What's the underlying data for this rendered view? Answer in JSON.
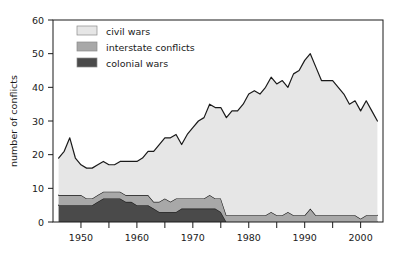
{
  "chart_data": {
    "type": "area",
    "stacked": true,
    "title": "",
    "subtitle": "",
    "xlabel": "",
    "ylabel": "number of conflicts",
    "xlim": [
      1945,
      2004
    ],
    "ylim": [
      0,
      60
    ],
    "yticks": [
      0,
      10,
      20,
      30,
      40,
      50,
      60
    ],
    "ytick_labels": [
      "0",
      "10",
      "20",
      "30",
      "40",
      "50",
      "60"
    ],
    "xticks": [
      1950,
      1955,
      1960,
      1965,
      1970,
      1975,
      1980,
      1985,
      1990,
      1995,
      2000
    ],
    "xtick_labels": [
      "1950",
      "",
      "1960",
      "",
      "1970",
      "",
      "1980",
      "",
      "1990",
      "",
      "2000"
    ],
    "xtick_labels_major": [
      "1950",
      "1960",
      "1970",
      "1980",
      "1990",
      "2000"
    ],
    "xtick_minor_interval": 5,
    "grid": false,
    "legend_position": "top-left",
    "x": [
      1946,
      1947,
      1948,
      1949,
      1950,
      1951,
      1952,
      1953,
      1954,
      1955,
      1956,
      1957,
      1958,
      1959,
      1960,
      1961,
      1962,
      1963,
      1964,
      1965,
      1966,
      1967,
      1968,
      1969,
      1970,
      1971,
      1972,
      1973,
      1974,
      1975,
      1976,
      1977,
      1978,
      1979,
      1980,
      1981,
      1982,
      1983,
      1984,
      1985,
      1986,
      1987,
      1988,
      1989,
      1990,
      1991,
      1992,
      1993,
      1994,
      1995,
      1996,
      1997,
      1998,
      1999,
      2000,
      2001,
      2002,
      2003
    ],
    "series": [
      {
        "name": "colonial wars",
        "color": "#4a4a4a",
        "values": [
          5,
          5,
          5,
          5,
          5,
          5,
          5,
          6,
          7,
          7,
          7,
          7,
          6,
          6,
          5,
          5,
          5,
          4,
          3,
          3,
          3,
          3,
          4,
          4,
          4,
          4,
          4,
          4,
          4,
          3,
          0,
          0,
          0,
          0,
          0,
          0,
          0,
          0,
          0,
          0,
          0,
          0,
          0,
          0,
          0,
          0,
          0,
          0,
          0,
          0,
          0,
          0,
          0,
          0,
          0,
          0,
          0,
          0
        ]
      },
      {
        "name": "interstate conflicts",
        "color": "#a8a8a8",
        "values": [
          3,
          3,
          3,
          3,
          3,
          2,
          2,
          2,
          2,
          2,
          2,
          2,
          2,
          2,
          3,
          3,
          3,
          2,
          3,
          4,
          3,
          4,
          3,
          3,
          3,
          3,
          3,
          4,
          3,
          4,
          2,
          2,
          2,
          2,
          2,
          2,
          2,
          2,
          3,
          2,
          2,
          3,
          2,
          2,
          2,
          4,
          2,
          2,
          2,
          2,
          2,
          2,
          2,
          2,
          1,
          2,
          2,
          2
        ]
      },
      {
        "name": "civil wars",
        "color": "#e6e6e6",
        "values": [
          11,
          13,
          17,
          11,
          9,
          9,
          9,
          9,
          9,
          8,
          8,
          9,
          10,
          10,
          10,
          11,
          13,
          15,
          17,
          18,
          19,
          19,
          16,
          19,
          21,
          23,
          24,
          27,
          27,
          27,
          29,
          31,
          31,
          33,
          36,
          37,
          36,
          38,
          40,
          39,
          40,
          37,
          42,
          43,
          46,
          46,
          44,
          40,
          40,
          40,
          38,
          36,
          33,
          34,
          32,
          34,
          31,
          28
        ]
      }
    ],
    "totals": [
      19,
      21,
      25,
      19,
      17,
      16,
      16,
      17,
      18,
      17,
      17,
      18,
      18,
      18,
      18,
      19,
      21,
      21,
      23,
      25,
      25,
      26,
      23,
      26,
      28,
      30,
      31,
      35,
      34,
      34,
      31,
      33,
      33,
      35,
      38,
      39,
      38,
      40,
      43,
      41,
      42,
      40,
      44,
      45,
      48,
      50,
      46,
      42,
      42,
      42,
      40,
      38,
      35,
      36,
      33,
      36,
      33,
      30
    ]
  },
  "legend": {
    "items": [
      {
        "label": "civil wars",
        "color": "#e6e6e6",
        "swatch_name": "legend-swatch-civil-wars"
      },
      {
        "label": "interstate conflicts",
        "color": "#a8a8a8",
        "swatch_name": "legend-swatch-interstate-conflicts"
      },
      {
        "label": "colonial wars",
        "color": "#4a4a4a",
        "swatch_name": "legend-swatch-colonial-wars"
      }
    ]
  },
  "axes": {
    "y_title": "number of conflicts",
    "y_labels": [
      "60",
      "50",
      "40",
      "30",
      "20",
      "10",
      "0"
    ],
    "x_labels": [
      "1950",
      "1960",
      "1970",
      "1980",
      "1990",
      "2000"
    ]
  },
  "colors": {
    "civil_wars": "#e6e6e6",
    "interstate_conflicts": "#a8a8a8",
    "colonial_wars": "#4a4a4a",
    "axis": "#1a1a1a",
    "background": "#ffffff"
  }
}
